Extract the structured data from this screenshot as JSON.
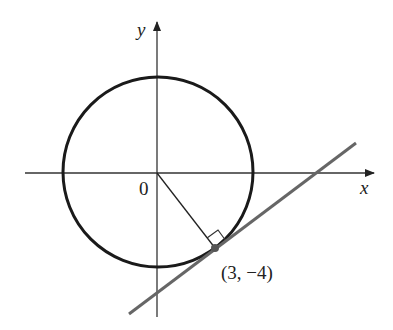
{
  "figure": {
    "type": "circle-with-tangent-line",
    "labels": {
      "x_axis": "x",
      "y_axis": "y",
      "origin": "0",
      "tangent_point": "(3, −4)"
    },
    "circle": {
      "center": [
        0,
        0
      ],
      "radius": 5
    },
    "tangent_point": [
      3,
      -4
    ],
    "radius_segment": {
      "from": [
        0,
        0
      ],
      "to": [
        3,
        -4
      ]
    },
    "tangent_line": "perpendicular to radius at (3, −4)",
    "right_angle_marker": true,
    "colors": {
      "circle": "#1a1a1a",
      "tangent_line": "#666666",
      "axes": "#333333",
      "radius": "#222222",
      "point": "#555555"
    }
  }
}
